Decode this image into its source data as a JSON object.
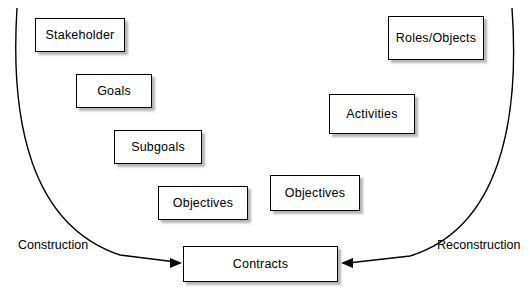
{
  "diagram": {
    "nodes": [
      {
        "id": "stakeholder",
        "label": "Stakeholder",
        "x": 35,
        "y": 18,
        "w": 90,
        "h": 34
      },
      {
        "id": "goals",
        "label": "Goals",
        "x": 76,
        "y": 74,
        "w": 76,
        "h": 34
      },
      {
        "id": "subgoals",
        "label": "Subgoals",
        "x": 114,
        "y": 130,
        "w": 88,
        "h": 34
      },
      {
        "id": "objectives-left",
        "label": "Objectives",
        "x": 158,
        "y": 186,
        "w": 90,
        "h": 34
      },
      {
        "id": "objectives-right",
        "label": "Objectives",
        "x": 270,
        "y": 175,
        "w": 90,
        "h": 36
      },
      {
        "id": "activities",
        "label": "Activities",
        "x": 329,
        "y": 94,
        "w": 86,
        "h": 40
      },
      {
        "id": "roles-objects",
        "label": "Roles/Objects",
        "x": 388,
        "y": 16,
        "w": 96,
        "h": 44
      },
      {
        "id": "contracts",
        "label": "Contracts",
        "x": 183,
        "y": 246,
        "w": 155,
        "h": 36
      }
    ],
    "labels": {
      "construction": "Construction",
      "reconstruction": "Reconstruction"
    },
    "colors": {
      "line": "#000000",
      "box_fill": "#ffffff",
      "box_border": "#000000",
      "shadow": "#787878"
    }
  }
}
